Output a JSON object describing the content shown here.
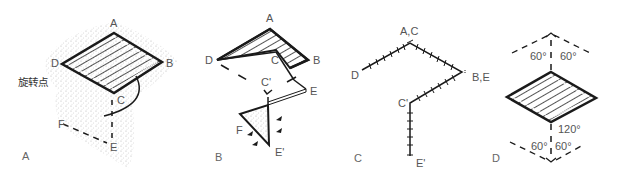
{
  "diagram": {
    "colors": {
      "line": "#1a1a1a",
      "label": "#555555",
      "stipple": "#bdbdbd"
    },
    "panels": [
      {
        "id": "A",
        "label": "A",
        "points": {
          "A": "A",
          "B": "B",
          "C": "C",
          "D": "D",
          "E": "E",
          "F": "F"
        },
        "annotation": "旋转点"
      },
      {
        "id": "B",
        "label": "B",
        "points": {
          "A": "A",
          "B": "B",
          "C": "C",
          "D": "D",
          "E": "E",
          "C_prime": "C'",
          "E_prime": "E'",
          "F": "F"
        }
      },
      {
        "id": "C",
        "label": "C",
        "points": {
          "AC": "A,C",
          "BE": "B,E",
          "D": "D",
          "C_prime": "C'",
          "E_prime": "E'"
        }
      },
      {
        "id": "D",
        "label": "D",
        "angles": {
          "top_left": "60°",
          "top_right": "60°",
          "bottom_center": "120°",
          "bottom_left": "60°",
          "bottom_right": "60°"
        }
      }
    ]
  }
}
